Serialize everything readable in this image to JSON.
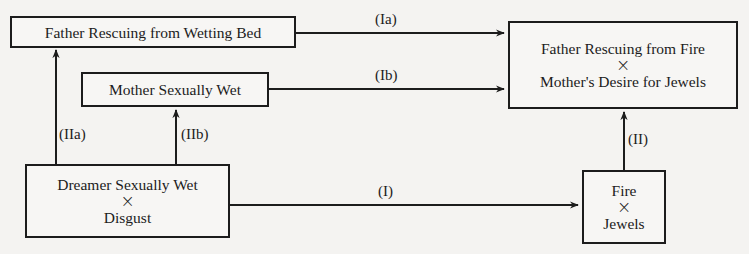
{
  "diagram": {
    "nodes": {
      "father_wetting": {
        "line1": "Father Rescuing from Wetting Bed"
      },
      "mother_wet": {
        "line1": "Mother Sexually Wet"
      },
      "manifest": {
        "line1": "Father Rescuing from Fire",
        "operator": "×",
        "line2": "Mother's Desire for Jewels"
      },
      "dreamer": {
        "line1": "Dreamer Sexually Wet",
        "operator": "×",
        "line2": "Disgust"
      },
      "fire_jewels": {
        "line1": "Fire",
        "operator": "×",
        "line2": "Jewels"
      }
    },
    "edges": {
      "Ia": {
        "label": "(Ia)",
        "from": "Father Rescuing from Wetting Bed",
        "to": "Father Rescuing from Fire × Mother's Desire for Jewels"
      },
      "Ib": {
        "label": "(Ib)",
        "from": "Mother Sexually Wet",
        "to": "Father Rescuing from Fire × Mother's Desire for Jewels"
      },
      "IIa": {
        "label": "(IIa)",
        "from": "Dreamer Sexually Wet × Disgust",
        "to": "Father Rescuing from Wetting Bed"
      },
      "IIb": {
        "label": "(IIb)",
        "from": "Dreamer Sexually Wet × Disgust",
        "to": "Mother Sexually Wet"
      },
      "I": {
        "label": "(I)",
        "from": "Dreamer Sexually Wet × Disgust",
        "to": "Fire × Jewels"
      },
      "II": {
        "label": "(II)",
        "from": "Fire × Jewels",
        "to": "Father Rescuing from Fire × Mother's Desire for Jewels"
      }
    },
    "colors": {
      "background": "#f4f3f1",
      "ink": "#1c1c1c"
    }
  }
}
